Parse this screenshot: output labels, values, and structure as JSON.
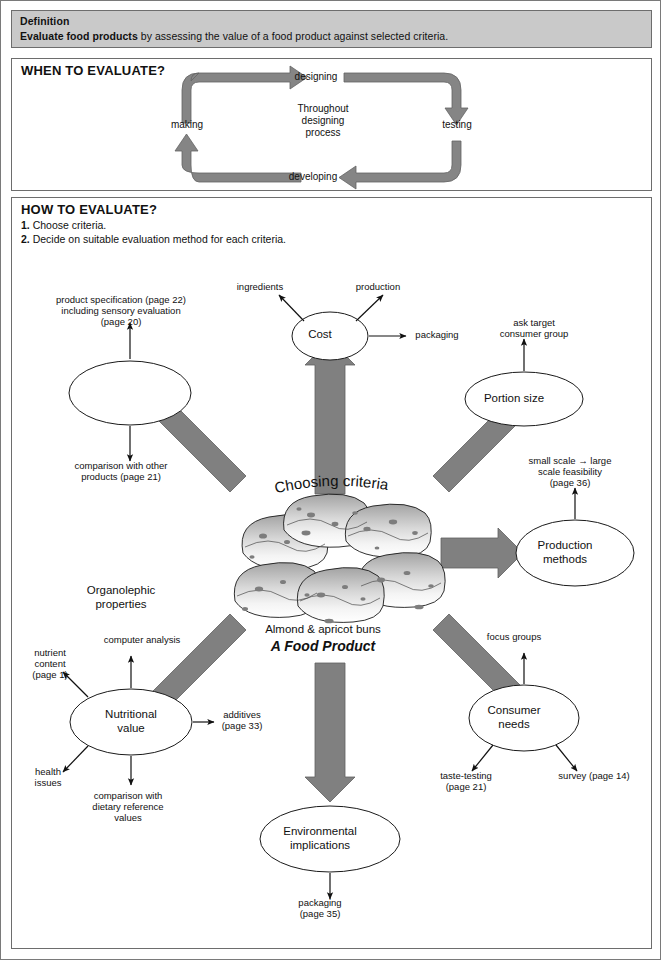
{
  "definition": {
    "title": "Definition",
    "lead": "Evaluate food products",
    "rest": " by assessing the value of a food product against selected criteria."
  },
  "when_section": {
    "title": "WHEN TO EVALUATE?",
    "center_text_lines": [
      "Throughout",
      "designing",
      "process"
    ],
    "stages": [
      {
        "label": "designing"
      },
      {
        "label": "testing"
      },
      {
        "label": "developing"
      },
      {
        "label": "making"
      }
    ]
  },
  "how_section": {
    "title": "HOW TO EVALUATE?",
    "steps": [
      {
        "num": "1.",
        "text": "Choose criteria."
      },
      {
        "num": "2.",
        "text": "Decide on suitable evaluation method for each criteria."
      }
    ]
  },
  "center": {
    "curved_caption": "Choosing criteria",
    "product_name": "Almond & apricot buns",
    "product_tag": "A Food Product"
  },
  "criteria": [
    {
      "id": "organolephic",
      "label_lines": [
        "Organolephic",
        "properties"
      ],
      "leaves": [
        {
          "lines": [
            "product specification (page 22)",
            "including sensory evaluation",
            "(page 20)"
          ]
        },
        {
          "lines": [
            "comparison with other",
            "products (page 21)"
          ]
        }
      ]
    },
    {
      "id": "cost",
      "label_lines": [
        "Cost"
      ],
      "leaves": [
        {
          "lines": [
            "ingredients"
          ]
        },
        {
          "lines": [
            "production"
          ]
        },
        {
          "lines": [
            "packaging"
          ]
        }
      ]
    },
    {
      "id": "portion-size",
      "label_lines": [
        "Portion size"
      ],
      "leaves": [
        {
          "lines": [
            "ask target",
            "consumer group"
          ]
        }
      ]
    },
    {
      "id": "production-methods",
      "label_lines": [
        "Production",
        "methods"
      ],
      "leaves": [
        {
          "lines": [
            "small scale → large",
            "scale feasibility",
            "(page 36)"
          ]
        }
      ]
    },
    {
      "id": "consumer-needs",
      "label_lines": [
        "Consumer",
        "needs"
      ],
      "leaves": [
        {
          "lines": [
            "focus groups"
          ]
        },
        {
          "lines": [
            "taste-testing",
            "(page 21)"
          ]
        },
        {
          "lines": [
            "survey (page 14)"
          ]
        }
      ]
    },
    {
      "id": "environmental-implications",
      "label_lines": [
        "Environmental",
        "implications"
      ],
      "leaves": [
        {
          "lines": [
            "packaging",
            "(page 35)"
          ]
        }
      ]
    },
    {
      "id": "nutritional-value",
      "label_lines": [
        "Nutritional",
        "value"
      ],
      "leaves": [
        {
          "lines": [
            "computer analysis"
          ]
        },
        {
          "lines": [
            "nutrient",
            "content",
            "(page 1)"
          ]
        },
        {
          "lines": [
            "additives",
            "(page 33)"
          ]
        },
        {
          "lines": [
            "health",
            "issues"
          ]
        },
        {
          "lines": [
            "comparison with",
            "dietary reference",
            "values"
          ]
        }
      ]
    }
  ],
  "colors": {
    "panel_border": "#6d6d6d",
    "definition_fill": "#c9c9c9",
    "arrow_fill": "#808080",
    "arrow_stroke": "#5f5f5f",
    "ink": "#111111",
    "bun_light": "#f2f2f2",
    "bun_mid": "#c2c2c2",
    "bun_dark": "#8e8e8e"
  }
}
